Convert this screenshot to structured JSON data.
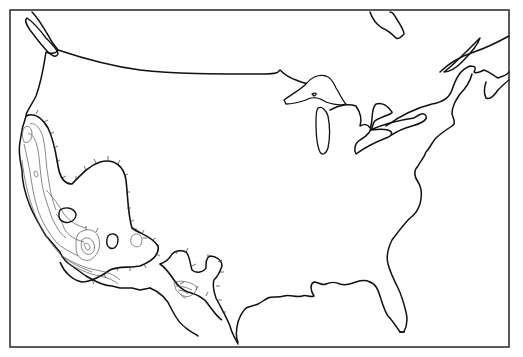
{
  "map": {
    "title": "",
    "area": "United States (conterminous) with southern Canada and northern Mexico",
    "projection_frame": {
      "left": 10,
      "top": 10,
      "right": 509,
      "bottom": 347
    },
    "colors": {
      "background": "#ffffff",
      "coastline": "#111111",
      "frame": "#333333",
      "contour": "#555555"
    },
    "features": [
      {
        "name": "pacific-coast",
        "kind": "coastline"
      },
      {
        "name": "canada-us-border",
        "kind": "boundary"
      },
      {
        "name": "great-lakes",
        "kind": "lakes"
      },
      {
        "name": "atlantic-coast",
        "kind": "coastline"
      },
      {
        "name": "gulf-coast",
        "kind": "coastline"
      },
      {
        "name": "florida-peninsula",
        "kind": "coastline"
      },
      {
        "name": "hudson-bay-shore",
        "kind": "coastline"
      },
      {
        "name": "vancouver-island",
        "kind": "island"
      },
      {
        "name": "southwest-hachured-region",
        "kind": "contoured-region"
      },
      {
        "name": "mexico-hachured-region",
        "kind": "contoured-region"
      }
    ],
    "legend": null
  }
}
